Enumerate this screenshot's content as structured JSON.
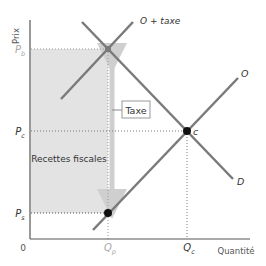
{
  "diagram": {
    "axes": {
      "y_label": "Prix",
      "x_label": "Quantité",
      "origin_label": "0"
    },
    "price_labels": {
      "pb": {
        "main": "P",
        "sub": "b"
      },
      "pc": {
        "main": "P",
        "sub": "c"
      },
      "ps": {
        "main": "P",
        "sub": "s"
      }
    },
    "quantity_labels": {
      "qp": {
        "main": "Q",
        "sub": "p"
      },
      "qc": {
        "main": "Q",
        "sub": "c"
      }
    },
    "curves": {
      "supply": "O",
      "supply_with_tax": "O + taxe",
      "demand": "D"
    },
    "points": {
      "equilibrium": "c"
    },
    "annotations": {
      "tax_label": "Taxe",
      "revenue_label": "Recettes fiscales"
    },
    "colors": {
      "shade": "#e3e3e3",
      "curve": "#7a7a7a",
      "axis": "#555555",
      "arrow": "#cfcfcf",
      "point": "#111111",
      "gray_label": "#a8a8a8",
      "text": "#333333"
    }
  }
}
